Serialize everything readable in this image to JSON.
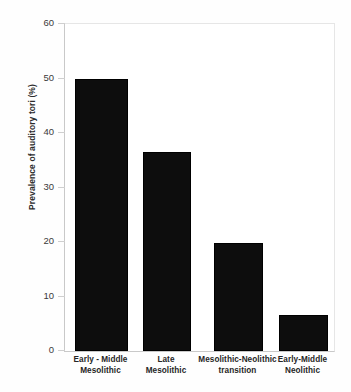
{
  "chart_data": {
    "type": "bar",
    "title": "",
    "subtitle": "",
    "xlabel": "",
    "ylabel": "Prevalence of auditory tori (%)",
    "categories": [
      "Early - Middle Mesolithic",
      "Late Mesolithic",
      "Mesolithic-Neolithic transition",
      "Early-Middle Neolithic"
    ],
    "category_lines": [
      [
        "Early - Middle",
        "Mesolithic"
      ],
      [
        "Late",
        "Mesolithic"
      ],
      [
        "Mesolithic-Neolithic",
        "transition"
      ],
      [
        "Early-Middle",
        "Neolithic"
      ]
    ],
    "values": [
      50.0,
      36.5,
      19.8,
      6.7
    ],
    "ylim": [
      0,
      60
    ],
    "yticks": [
      0,
      10,
      20,
      30,
      40,
      50,
      60
    ],
    "ytick_labels": [
      "0",
      "10",
      "20",
      "30",
      "40",
      "50",
      "60"
    ],
    "grid": false,
    "legend": null,
    "legend_position": "none",
    "bar_color": "#0d0d0d",
    "axis_color": "#c9c9c9",
    "background_color": "#ffffff"
  }
}
